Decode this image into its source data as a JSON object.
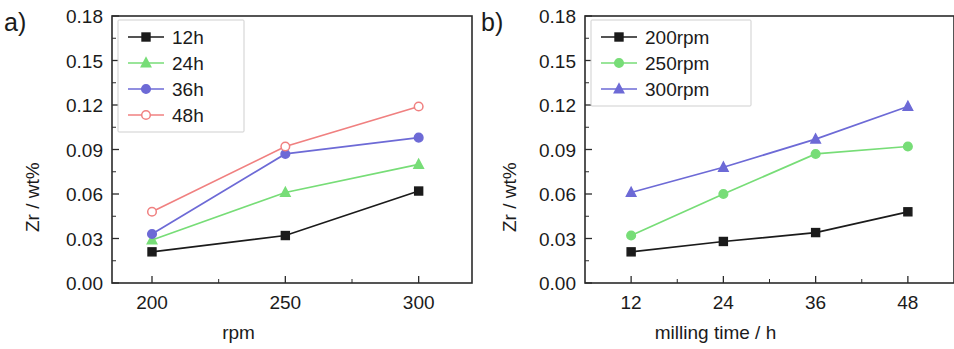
{
  "figure": {
    "panels": [
      {
        "letter": "a)",
        "ylabel": "Zr / wt%",
        "xlabel": "rpm"
      },
      {
        "letter": "b)",
        "ylabel": "Zr / wt%",
        "xlabel": "milling time / h"
      }
    ]
  },
  "colors": {
    "black": "#1b1b1b",
    "green": "#77dd77",
    "blue": "#6d6ad6",
    "red": "#f08080",
    "axis": "#2b2b2b"
  },
  "chart_data": [
    {
      "type": "line",
      "panel": "a)",
      "title": "",
      "xlabel": "rpm",
      "ylabel": "Zr / wt%",
      "x": [
        200,
        250,
        300
      ],
      "categories": [
        "200",
        "250",
        "300"
      ],
      "xtick_labels": [
        "200",
        "250",
        "300"
      ],
      "ytick_labels": [
        "0.00",
        "0.03",
        "0.06",
        "0.09",
        "0.12",
        "0.15",
        "0.18"
      ],
      "yticks": [
        0.0,
        0.03,
        0.06,
        0.09,
        0.12,
        0.15,
        0.18
      ],
      "xlim": [
        185,
        320
      ],
      "ylim": [
        0.0,
        0.18
      ],
      "grid": false,
      "legend_position": "top-left",
      "series": [
        {
          "name": "12h",
          "values": [
            0.021,
            0.032,
            0.062
          ],
          "color": "#1b1b1b",
          "marker": "square",
          "filled": true
        },
        {
          "name": "24h",
          "values": [
            0.029,
            0.061,
            0.08
          ],
          "color": "#77dd77",
          "marker": "triangle",
          "filled": true
        },
        {
          "name": "36h",
          "values": [
            0.033,
            0.087,
            0.098
          ],
          "color": "#6d6ad6",
          "marker": "circle",
          "filled": true
        },
        {
          "name": "48h",
          "values": [
            0.048,
            0.092,
            0.119
          ],
          "color": "#f08080",
          "marker": "circle",
          "filled": false
        }
      ]
    },
    {
      "type": "line",
      "panel": "b)",
      "title": "",
      "xlabel": "milling time / h",
      "ylabel": "Zr / wt%",
      "x": [
        12,
        24,
        36,
        48
      ],
      "categories": [
        "12",
        "24",
        "36",
        "48"
      ],
      "xtick_labels": [
        "12",
        "24",
        "36",
        "48"
      ],
      "ytick_labels": [
        "0.00",
        "0.03",
        "0.06",
        "0.09",
        "0.12",
        "0.15",
        "0.18"
      ],
      "yticks": [
        0.0,
        0.03,
        0.06,
        0.09,
        0.12,
        0.15,
        0.18
      ],
      "xlim": [
        6,
        54
      ],
      "ylim": [
        0.0,
        0.18
      ],
      "grid": false,
      "legend_position": "top-left",
      "series": [
        {
          "name": "200rpm",
          "values": [
            0.021,
            0.028,
            0.034,
            0.048
          ],
          "color": "#1b1b1b",
          "marker": "square",
          "filled": true
        },
        {
          "name": "250rpm",
          "values": [
            0.032,
            0.06,
            0.087,
            0.092
          ],
          "color": "#77dd77",
          "marker": "circle",
          "filled": true
        },
        {
          "name": "300rpm",
          "values": [
            0.061,
            0.078,
            0.097,
            0.119
          ],
          "color": "#6d6ad6",
          "marker": "triangle",
          "filled": true
        }
      ]
    }
  ]
}
